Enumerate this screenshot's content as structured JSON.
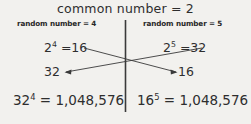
{
  "diagram": {
    "title": "common number = 2",
    "divider": {
      "name": "vertical-divider",
      "color": "#3a3a3a"
    },
    "columns": [
      {
        "side": "left",
        "subhead": "random number = 4",
        "top_equation": {
          "base": "2",
          "exponent": "4",
          "equals": "=16",
          "full": "2⁴ =16"
        },
        "middle_value": "32",
        "bottom_equation": {
          "base": "32",
          "exponent": "4",
          "equals": "= 1,048,576",
          "full": "32⁴ = 1,048,576"
        }
      },
      {
        "side": "right",
        "subhead": "random number = 5",
        "top_equation": {
          "base": "2",
          "exponent": "5",
          "equals": "=32",
          "full": "2⁵ =32"
        },
        "middle_value": "16",
        "bottom_equation": {
          "base": "16",
          "exponent": "5",
          "equals": "= 1,048,576",
          "full": "16⁵ = 1,048,576"
        }
      }
    ],
    "arrows": [
      {
        "name": "arrow-left-result-to-right-slot",
        "from": "2^4 =16",
        "to": "16",
        "direction": "down-right"
      },
      {
        "name": "arrow-right-result-to-left-slot",
        "from": "2^5 =32",
        "to": "32",
        "direction": "down-left"
      }
    ],
    "colors": {
      "background": "#f2f1ee",
      "ink": "#2e2e2e",
      "line": "#3a3a3a"
    }
  }
}
